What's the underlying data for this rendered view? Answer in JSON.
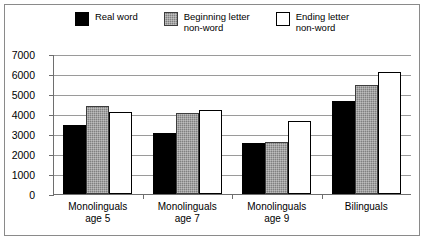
{
  "chart_data": {
    "type": "bar",
    "title": "",
    "subtitle": "",
    "xlabel": "",
    "ylabel": "",
    "ylim": [
      0,
      7000
    ],
    "ytick_labels": [
      "0",
      "1000",
      "2000",
      "3000",
      "4000",
      "5000",
      "6000",
      "7000"
    ],
    "ytick_values": [
      0,
      1000,
      2000,
      3000,
      4000,
      5000,
      6000,
      7000
    ],
    "grid": true,
    "legend_position": "top",
    "categories": [
      "Monolinguals\nage 5",
      "Monolinguals\nage 7",
      "Monolinguals\nage 9",
      "Bilinguals"
    ],
    "series": [
      {
        "name": "Real word",
        "color": "#000000",
        "values": [
          3450,
          3050,
          2530,
          4630
        ]
      },
      {
        "name": "Beginning letter\nnon-word",
        "color": "#808080",
        "values": [
          4400,
          4060,
          2610,
          5450
        ]
      },
      {
        "name": "Ending letter\nnon-word",
        "color": "#ffffff",
        "values": [
          4110,
          4180,
          3650,
          6100
        ]
      }
    ]
  },
  "legend": {
    "entries": [
      {
        "label": "Real word",
        "swatch": "legend-swatch-black"
      },
      {
        "label": "Beginning letter\nnon-word",
        "swatch": "legend-swatch-gray"
      },
      {
        "label": "Ending letter\nnon-word",
        "swatch": "legend-swatch-white"
      }
    ]
  }
}
